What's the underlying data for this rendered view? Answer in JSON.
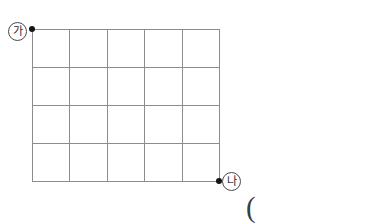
{
  "figure": {
    "background_color": "#ffffff",
    "grid_line_color": "#8d8d8d",
    "dot_color": "#141414",
    "label_text_color": "#2a2a2a",
    "columns": 5,
    "rows": 4,
    "vertical_line_count": 6,
    "horizontal_line_count": 5,
    "geometry": {
      "left": 32,
      "top": 29,
      "right": 219,
      "bottom": 181,
      "cell_width": 37.4,
      "cell_height": 38.0,
      "vertical_line_x": [
        32,
        69,
        107,
        144,
        182,
        219
      ],
      "horizontal_line_y": [
        29,
        67,
        105,
        143,
        181
      ]
    },
    "nodes": [
      {
        "name": "start-node",
        "label": "가",
        "x": 32,
        "y": 29
      },
      {
        "name": "end-node",
        "label": "나",
        "x": 219,
        "y": 181
      }
    ],
    "labels": {
      "start": "가",
      "end": "나"
    },
    "annotations": {
      "trailing_paren": "("
    }
  }
}
